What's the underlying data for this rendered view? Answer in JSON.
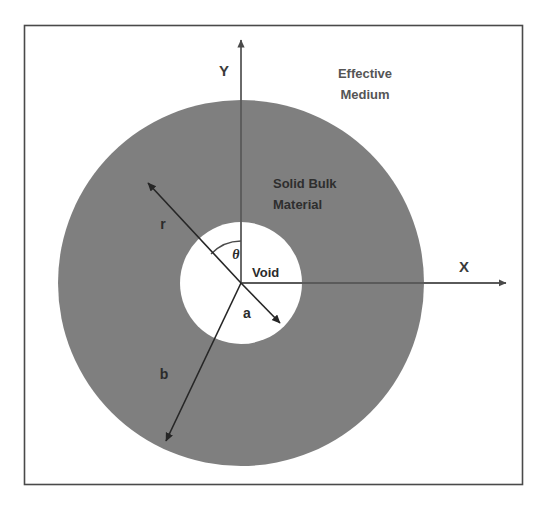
{
  "figure": {
    "background_color": "#ffffff",
    "frame": {
      "stroke_color": "#4a4a4a",
      "fill_color": "#ffffff",
      "x": 24,
      "y": 25,
      "width": 499,
      "height": 460
    }
  },
  "colors": {
    "solid_bulk_fill": "#7f7f7f",
    "void_fill": "#ffffff",
    "effective_medium_fill": "#ffffff",
    "axis_stroke": "#5a5a5a",
    "arrow_stroke": "#262626",
    "text_dark": "#2b2b2b",
    "text_gray": "#555555",
    "frame_stroke": "#4a4a4a"
  },
  "geometry": {
    "origin": {
      "x": 241,
      "y": 283
    },
    "outer_radius": 183,
    "void_radius": 61,
    "theta_arc_radius": 42,
    "r_arrow_tip": {
      "x": 145,
      "y": 180
    },
    "b_arrow_tip": {
      "x": 163,
      "y": 445
    },
    "a_arrow_tip": {
      "x": 283,
      "y": 326
    },
    "x_axis_tip": {
      "x": 510,
      "y": 283
    },
    "y_axis_tip": {
      "x": 241,
      "y": 36
    }
  },
  "axes": {
    "x_label": "X",
    "y_label": "Y",
    "x_label_pos": {
      "x": 464,
      "y": 272
    },
    "y_label_pos": {
      "x": 224,
      "y": 76
    }
  },
  "regions": [
    {
      "id": "effective-medium",
      "label_line1": "Effective",
      "label_line2": "Medium",
      "label_pos": {
        "x": 365,
        "y": 78
      },
      "fill": "#ffffff"
    },
    {
      "id": "solid-bulk-material",
      "label_line1": "Solid Bulk",
      "label_line2": "Material",
      "label_pos": {
        "x": 273,
        "y": 188
      },
      "fill": "#7f7f7f"
    },
    {
      "id": "void",
      "label_line1": "Void",
      "label_line2": "",
      "label_pos": {
        "x": 252,
        "y": 277
      },
      "fill": "#ffffff"
    }
  ],
  "dimensions": [
    {
      "id": "r",
      "label": "r",
      "description": "radial coordinate to field point in bulk material",
      "label_pos": {
        "x": 163,
        "y": 229
      }
    },
    {
      "id": "b",
      "label": "b",
      "description": "outer radius of solid bulk material shell",
      "label_pos": {
        "x": 164,
        "y": 379
      }
    },
    {
      "id": "a",
      "label": "a",
      "description": "radius of spherical void",
      "label_pos": {
        "x": 247,
        "y": 318
      }
    },
    {
      "id": "theta",
      "label": "θ",
      "description": "polar angle measured from the Y axis",
      "label_pos": {
        "x": 236,
        "y": 259
      }
    }
  ]
}
